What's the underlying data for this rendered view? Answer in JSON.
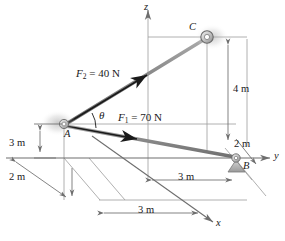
{
  "figure": {
    "type": "statics-free-body-diagram",
    "axes": {
      "z_label": "z",
      "y_label": "y",
      "x_label": "x"
    },
    "points": {
      "a_label": "A",
      "b_label": "B",
      "c_label": "C"
    },
    "forces": [
      {
        "id": "f1",
        "label_main": "F",
        "label_sub": "1",
        "label_rest": " = 70 N",
        "magnitude": 70,
        "unit": "N",
        "direction": "A to B"
      },
      {
        "id": "f2",
        "label_main": "F",
        "label_sub": "2",
        "label_rest": " = 40 N",
        "magnitude": 40,
        "unit": "N",
        "direction": "A to C"
      }
    ],
    "angle": {
      "label": "θ",
      "between": "F1 and F2"
    },
    "dimensions": [
      {
        "id": "dim-3m-vertical-left",
        "label": "3 m",
        "value": 3,
        "unit": "m"
      },
      {
        "id": "dim-2m-lower-left",
        "label": "2 m",
        "value": 2,
        "unit": "m"
      },
      {
        "id": "dim-3m-lower",
        "label": "3 m",
        "value": 3,
        "unit": "m"
      },
      {
        "id": "dim-3m-bottom",
        "label": "3 m",
        "value": 3,
        "unit": "m"
      },
      {
        "id": "dim-4m-right",
        "label": "4 m",
        "value": 4,
        "unit": "m"
      },
      {
        "id": "dim-2m-right",
        "label": "2 m",
        "value": 2,
        "unit": "m"
      }
    ],
    "colors": {
      "line": "#808080",
      "cable": "#8a8a8a",
      "arrow": "#1a1a1a",
      "text": "#1a1a1a",
      "support_fill": "#b0b0b0"
    }
  }
}
